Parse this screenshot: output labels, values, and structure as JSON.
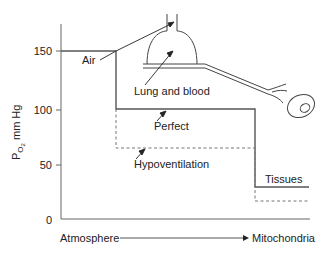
{
  "diagram": {
    "y_axis": {
      "label_main": "P",
      "label_sub": "O",
      "label_subsub": "2",
      "label_unit": " mm Hg",
      "ticks": [
        "150",
        "100",
        "50",
        "0"
      ]
    },
    "x_axis": {
      "start_label": "Atmosphere",
      "end_label": "Mitochondria"
    },
    "labels": {
      "air": "Air",
      "lung_blood": "Lung and blood",
      "perfect": "Perfect",
      "hypoventilation": "Hypoventilation",
      "tissues": "Tissues"
    },
    "cascade": {
      "perfect": [
        {
          "stage": "Atmosphere/Air",
          "po2": 150
        },
        {
          "stage": "Lung and blood",
          "po2": 100
        },
        {
          "stage": "Tissues",
          "po2": 30
        }
      ],
      "hypoventilation": [
        {
          "stage": "Atmosphere/Air",
          "po2": 150
        },
        {
          "stage": "Lung and blood",
          "po2": 65
        },
        {
          "stage": "Tissues",
          "po2": 17
        }
      ]
    },
    "colors": {
      "line": "#555555",
      "text": "#222222"
    }
  }
}
